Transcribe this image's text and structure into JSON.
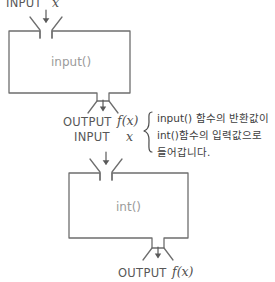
{
  "diagram": {
    "title_hidden": "",
    "colors": {
      "stroke": "#6e6e6e",
      "box_label": "#9b9b9b",
      "io_label": "#575757",
      "note_text": "#3d3d3d",
      "background": "#ffffff"
    },
    "top_input": {
      "label": "INPUT",
      "variable": "x"
    },
    "box_input": {
      "label": "input()"
    },
    "middle_output": {
      "label": "OUTPUT",
      "variable": "f(x)"
    },
    "middle_input": {
      "label": "INPUT",
      "variable": "x"
    },
    "box_int": {
      "label": "int()"
    },
    "bottom_output": {
      "label": "OUTPUT",
      "variable": "f(x)"
    },
    "note": {
      "line1": "input() 함수의 반환값이",
      "line2": "int()함수의 입력값으로",
      "line3": "들어갑니다."
    }
  }
}
